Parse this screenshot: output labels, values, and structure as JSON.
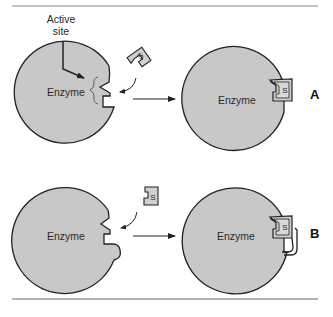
{
  "figure": {
    "top_caption": "",
    "colors": {
      "enzyme_fill": "#c8c8c8",
      "outline": "#222222",
      "rule": "#777777",
      "substrate_fill": "#d0d0d0"
    }
  },
  "annotation": {
    "active_site_line1": "Active",
    "active_site_line2": "site"
  },
  "panels": [
    {
      "id": "A",
      "label": "A",
      "before": {
        "enzyme_label": "Enzyme",
        "substrate_label": "S"
      },
      "after": {
        "enzyme_label": "Enzyme",
        "substrate_label": "S"
      }
    },
    {
      "id": "B",
      "label": "B",
      "before": {
        "enzyme_label": "Enzyme",
        "substrate_label": "S"
      },
      "after": {
        "enzyme_label": "Enzyme",
        "substrate_label": "S"
      }
    }
  ]
}
